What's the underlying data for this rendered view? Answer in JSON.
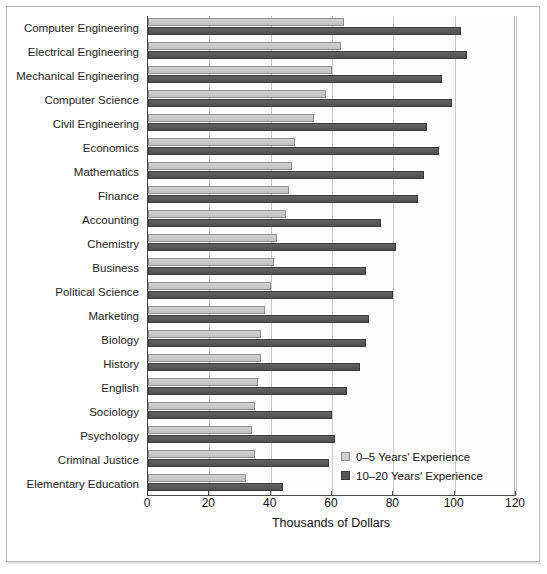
{
  "chart_data": {
    "type": "bar",
    "orientation": "horizontal",
    "title": "",
    "xlabel": "Thousands of Dollars",
    "ylabel": "",
    "xlim": [
      0,
      120
    ],
    "xticks": [
      0,
      20,
      40,
      60,
      80,
      100,
      120
    ],
    "grid": true,
    "legend_position": "inside-bottom-right",
    "categories": [
      "Computer Engineering",
      "Electrical Engineering",
      "Mechanical Engineering",
      "Computer Science",
      "Civil Engineering",
      "Economics",
      "Mathematics",
      "Finance",
      "Accounting",
      "Chemistry",
      "Business",
      "Political Science",
      "Marketing",
      "Biology",
      "History",
      "English",
      "Sociology",
      "Psychology",
      "Criminal Justice",
      "Elementary Education"
    ],
    "series": [
      {
        "name": "0–5 Years' Experience",
        "color": "#c6c6c6",
        "values": [
          64,
          63,
          60,
          58,
          54,
          48,
          47,
          46,
          45,
          42,
          41,
          40,
          38,
          37,
          37,
          36,
          35,
          34,
          35,
          32
        ]
      },
      {
        "name": "10–20 Years' Experience",
        "color": "#575757",
        "values": [
          102,
          104,
          96,
          99,
          91,
          95,
          90,
          88,
          76,
          81,
          71,
          80,
          72,
          71,
          69,
          65,
          60,
          61,
          59,
          44
        ]
      }
    ]
  },
  "axis": {
    "tick_labels": [
      "0",
      "20",
      "40",
      "60",
      "80",
      "100",
      "120"
    ],
    "title": "Thousands of Dollars"
  },
  "legend": {
    "items": [
      {
        "label": "0–5 Years' Experience",
        "swatch": "light-gray-square"
      },
      {
        "label": "10–20 Years' Experience",
        "swatch": "dark-gray-square"
      }
    ]
  }
}
